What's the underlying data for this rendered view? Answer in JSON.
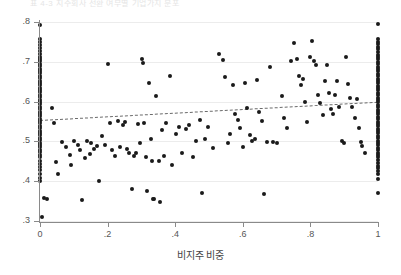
{
  "figure": {
    "caption_sliver": "표 4-3  지주회사 전환 여부별 기업가치 분포",
    "background": "#ffffff",
    "point_color": "#1a1a1a",
    "grid_color": "#ececec",
    "axis_color": "#8a8a8a",
    "trendline_color": "#6b6b6b"
  },
  "chart_data": {
    "type": "scatter",
    "title": "",
    "xlabel": "비지주 비중",
    "ylabel": "",
    "xlim": [
      0,
      1
    ],
    "ylim": [
      0.3,
      0.8
    ],
    "grid": true,
    "legend": null,
    "xticks": [
      0,
      0.2,
      0.4,
      0.6,
      0.8,
      1
    ],
    "xtick_labels": [
      "0",
      ".2",
      ".4",
      ".6",
      ".8",
      "1"
    ],
    "yticks": [
      0.3,
      0.4,
      0.5,
      0.6,
      0.7,
      0.8
    ],
    "ytick_labels": [
      ".3",
      ".4",
      ".5",
      ".6",
      ".7",
      ".8"
    ],
    "trendline": {
      "style": "dashed",
      "x": [
        0,
        1
      ],
      "y": [
        0.555,
        0.601
      ]
    },
    "points": [
      [
        0.0,
        0.793
      ],
      [
        0.0,
        0.757
      ],
      [
        0.0,
        0.749
      ],
      [
        0.0,
        0.742
      ],
      [
        0.0,
        0.735
      ],
      [
        0.0,
        0.727
      ],
      [
        0.0,
        0.719
      ],
      [
        0.0,
        0.713
      ],
      [
        0.0,
        0.707
      ],
      [
        0.0,
        0.701
      ],
      [
        0.0,
        0.695
      ],
      [
        0.0,
        0.689
      ],
      [
        0.0,
        0.683
      ],
      [
        0.0,
        0.677
      ],
      [
        0.0,
        0.671
      ],
      [
        0.0,
        0.665
      ],
      [
        0.0,
        0.659
      ],
      [
        0.0,
        0.653
      ],
      [
        0.0,
        0.647
      ],
      [
        0.0,
        0.641
      ],
      [
        0.0,
        0.635
      ],
      [
        0.0,
        0.629
      ],
      [
        0.0,
        0.623
      ],
      [
        0.0,
        0.617
      ],
      [
        0.0,
        0.611
      ],
      [
        0.0,
        0.605
      ],
      [
        0.0,
        0.599
      ],
      [
        0.0,
        0.593
      ],
      [
        0.0,
        0.587
      ],
      [
        0.0,
        0.581
      ],
      [
        0.0,
        0.575
      ],
      [
        0.0,
        0.569
      ],
      [
        0.0,
        0.563
      ],
      [
        0.0,
        0.557
      ],
      [
        0.0,
        0.551
      ],
      [
        0.0,
        0.545
      ],
      [
        0.0,
        0.539
      ],
      [
        0.0,
        0.533
      ],
      [
        0.0,
        0.527
      ],
      [
        0.0,
        0.521
      ],
      [
        0.0,
        0.515
      ],
      [
        0.0,
        0.509
      ],
      [
        0.0,
        0.503
      ],
      [
        0.0,
        0.497
      ],
      [
        0.0,
        0.491
      ],
      [
        0.0,
        0.485
      ],
      [
        0.0,
        0.479
      ],
      [
        0.0,
        0.473
      ],
      [
        0.0,
        0.467
      ],
      [
        0.0,
        0.461
      ],
      [
        0.0,
        0.452
      ],
      [
        0.0,
        0.444
      ],
      [
        0.0,
        0.436
      ],
      [
        0.0,
        0.428
      ],
      [
        0.0,
        0.418
      ],
      [
        0.0,
        0.409
      ],
      [
        0.0,
        0.401
      ],
      [
        0.012,
        0.357
      ],
      [
        0.022,
        0.356
      ],
      [
        0.005,
        0.309
      ],
      [
        0.035,
        0.585
      ],
      [
        0.042,
        0.545
      ],
      [
        0.048,
        0.447
      ],
      [
        0.052,
        0.419
      ],
      [
        0.066,
        0.498
      ],
      [
        0.078,
        0.487
      ],
      [
        0.088,
        0.467
      ],
      [
        0.093,
        0.441
      ],
      [
        0.102,
        0.5
      ],
      [
        0.112,
        0.492
      ],
      [
        0.118,
        0.478
      ],
      [
        0.124,
        0.352
      ],
      [
        0.133,
        0.459
      ],
      [
        0.14,
        0.502
      ],
      [
        0.147,
        0.468
      ],
      [
        0.152,
        0.497
      ],
      [
        0.16,
        0.482
      ],
      [
        0.168,
        0.489
      ],
      [
        0.175,
        0.4
      ],
      [
        0.182,
        0.513
      ],
      [
        0.193,
        0.491
      ],
      [
        0.201,
        0.694
      ],
      [
        0.206,
        0.546
      ],
      [
        0.213,
        0.479
      ],
      [
        0.222,
        0.463
      ],
      [
        0.231,
        0.551
      ],
      [
        0.238,
        0.487
      ],
      [
        0.245,
        0.54
      ],
      [
        0.252,
        0.549
      ],
      [
        0.258,
        0.482
      ],
      [
        0.264,
        0.472
      ],
      [
        0.271,
        0.381
      ],
      [
        0.278,
        0.463
      ],
      [
        0.285,
        0.47
      ],
      [
        0.291,
        0.544
      ],
      [
        0.296,
        0.497
      ],
      [
        0.302,
        0.706
      ],
      [
        0.304,
        0.697
      ],
      [
        0.308,
        0.545
      ],
      [
        0.313,
        0.461
      ],
      [
        0.318,
        0.375
      ],
      [
        0.322,
        0.647
      ],
      [
        0.328,
        0.506
      ],
      [
        0.331,
        0.452
      ],
      [
        0.334,
        0.355
      ],
      [
        0.338,
        0.355
      ],
      [
        0.344,
        0.613
      ],
      [
        0.351,
        0.451
      ],
      [
        0.356,
        0.347
      ],
      [
        0.362,
        0.529
      ],
      [
        0.368,
        0.463
      ],
      [
        0.374,
        0.546
      ],
      [
        0.385,
        0.664
      ],
      [
        0.392,
        0.441
      ],
      [
        0.402,
        0.519
      ],
      [
        0.412,
        0.536
      ],
      [
        0.421,
        0.47
      ],
      [
        0.431,
        0.53
      ],
      [
        0.442,
        0.54
      ],
      [
        0.452,
        0.461
      ],
      [
        0.462,
        0.502
      ],
      [
        0.472,
        0.553
      ],
      [
        0.478,
        0.371
      ],
      [
        0.489,
        0.506
      ],
      [
        0.498,
        0.536
      ],
      [
        0.512,
        0.483
      ],
      [
        0.531,
        0.719
      ],
      [
        0.541,
        0.704
      ],
      [
        0.548,
        0.663
      ],
      [
        0.556,
        0.497
      ],
      [
        0.563,
        0.519
      ],
      [
        0.571,
        0.642
      ],
      [
        0.578,
        0.568
      ],
      [
        0.586,
        0.555
      ],
      [
        0.592,
        0.533
      ],
      [
        0.601,
        0.487
      ],
      [
        0.607,
        0.646
      ],
      [
        0.613,
        0.585
      ],
      [
        0.621,
        0.517
      ],
      [
        0.628,
        0.5
      ],
      [
        0.636,
        0.506
      ],
      [
        0.642,
        0.654
      ],
      [
        0.648,
        0.574
      ],
      [
        0.656,
        0.551
      ],
      [
        0.663,
        0.369
      ],
      [
        0.671,
        0.498
      ],
      [
        0.681,
        0.688
      ],
      [
        0.69,
        0.499
      ],
      [
        0.702,
        0.497
      ],
      [
        0.715,
        0.613
      ],
      [
        0.723,
        0.559
      ],
      [
        0.731,
        0.534
      ],
      [
        0.742,
        0.702
      ],
      [
        0.751,
        0.748
      ],
      [
        0.759,
        0.707
      ],
      [
        0.766,
        0.665
      ],
      [
        0.772,
        0.641
      ],
      [
        0.778,
        0.658
      ],
      [
        0.784,
        0.6
      ],
      [
        0.791,
        0.548
      ],
      [
        0.799,
        0.713
      ],
      [
        0.806,
        0.752
      ],
      [
        0.812,
        0.702
      ],
      [
        0.818,
        0.691
      ],
      [
        0.823,
        0.617
      ],
      [
        0.829,
        0.597
      ],
      [
        0.836,
        0.566
      ],
      [
        0.842,
        0.652
      ],
      [
        0.848,
        0.693
      ],
      [
        0.855,
        0.621
      ],
      [
        0.861,
        0.582
      ],
      [
        0.867,
        0.569
      ],
      [
        0.873,
        0.617
      ],
      [
        0.879,
        0.652
      ],
      [
        0.886,
        0.587
      ],
      [
        0.893,
        0.502
      ],
      [
        0.899,
        0.497
      ],
      [
        0.906,
        0.711
      ],
      [
        0.912,
        0.644
      ],
      [
        0.918,
        0.61
      ],
      [
        0.924,
        0.586
      ],
      [
        0.931,
        0.56
      ],
      [
        0.938,
        0.607
      ],
      [
        0.944,
        0.534
      ],
      [
        0.949,
        0.498
      ],
      [
        0.954,
        0.488
      ],
      [
        0.962,
        0.471
      ],
      [
        1.0,
        0.794
      ],
      [
        1.0,
        0.758
      ],
      [
        1.0,
        0.751
      ],
      [
        1.0,
        0.744
      ],
      [
        1.0,
        0.737
      ],
      [
        1.0,
        0.731
      ],
      [
        1.0,
        0.724
      ],
      [
        1.0,
        0.718
      ],
      [
        1.0,
        0.712
      ],
      [
        1.0,
        0.706
      ],
      [
        1.0,
        0.7
      ],
      [
        1.0,
        0.694
      ],
      [
        1.0,
        0.688
      ],
      [
        1.0,
        0.682
      ],
      [
        1.0,
        0.676
      ],
      [
        1.0,
        0.67
      ],
      [
        1.0,
        0.664
      ],
      [
        1.0,
        0.658
      ],
      [
        1.0,
        0.652
      ],
      [
        1.0,
        0.646
      ],
      [
        1.0,
        0.64
      ],
      [
        1.0,
        0.634
      ],
      [
        1.0,
        0.628
      ],
      [
        1.0,
        0.622
      ],
      [
        1.0,
        0.616
      ],
      [
        1.0,
        0.61
      ],
      [
        1.0,
        0.604
      ],
      [
        1.0,
        0.598
      ],
      [
        1.0,
        0.592
      ],
      [
        1.0,
        0.586
      ],
      [
        1.0,
        0.58
      ],
      [
        1.0,
        0.574
      ],
      [
        1.0,
        0.568
      ],
      [
        1.0,
        0.562
      ],
      [
        1.0,
        0.556
      ],
      [
        1.0,
        0.55
      ],
      [
        1.0,
        0.544
      ],
      [
        1.0,
        0.538
      ],
      [
        1.0,
        0.532
      ],
      [
        1.0,
        0.526
      ],
      [
        1.0,
        0.52
      ],
      [
        1.0,
        0.514
      ],
      [
        1.0,
        0.508
      ],
      [
        1.0,
        0.502
      ],
      [
        1.0,
        0.496
      ],
      [
        1.0,
        0.49
      ],
      [
        1.0,
        0.484
      ],
      [
        1.0,
        0.478
      ],
      [
        1.0,
        0.472
      ],
      [
        1.0,
        0.466
      ],
      [
        1.0,
        0.46
      ],
      [
        1.0,
        0.453
      ],
      [
        1.0,
        0.446
      ],
      [
        1.0,
        0.439
      ],
      [
        1.0,
        0.432
      ],
      [
        1.0,
        0.425
      ],
      [
        1.0,
        0.418
      ],
      [
        1.0,
        0.405
      ],
      [
        1.0,
        0.371
      ]
    ]
  }
}
